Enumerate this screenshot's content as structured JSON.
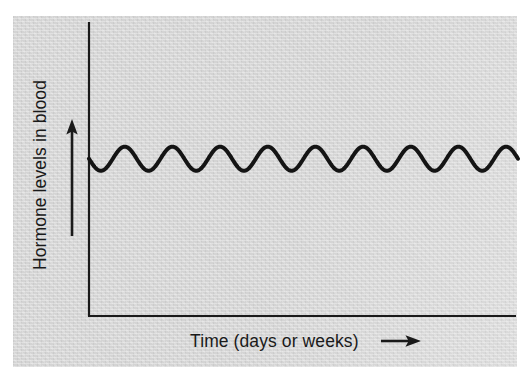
{
  "figure": {
    "background_color": "#ffffff",
    "panel_color": "#d5d5d5",
    "ink_color": "#1a1a1a"
  },
  "chart_data": {
    "type": "line",
    "title": "",
    "subtitle": "",
    "xlabel": "Time (days or weeks)",
    "ylabel": "Hormone levels in blood",
    "grid": false,
    "legend": null,
    "axis_style": "L-shaped spines, no tick marks, no tick labels",
    "x_axis_arrow": true,
    "y_axis_arrow": true,
    "xlim": [
      0,
      9
    ],
    "ylim": [
      0,
      1
    ],
    "annotations": [
      "Upward arrow beside the y-axis label indicating increasing hormone level",
      "Rightward arrow after the x-axis label indicating advancing time"
    ],
    "series": [
      {
        "name": "Hormone level",
        "waveform": "sine",
        "cycles": 9,
        "baseline": 0.535,
        "amplitude": 0.041,
        "phase_deg": 180,
        "description": "Steady low-amplitude oscillation around a constant baseline — hormone levels fluctuate rhythmically but show no overall trend over days or weeks.",
        "x": [
          0.0,
          0.25,
          0.5,
          0.75,
          1.0,
          1.25,
          1.5,
          1.75,
          2.0,
          2.25,
          2.5,
          2.75,
          3.0,
          3.25,
          3.5,
          3.75,
          4.0,
          4.25,
          4.5,
          4.75,
          5.0,
          5.25,
          5.5,
          5.75,
          6.0,
          6.25,
          6.5,
          6.75,
          7.0,
          7.25,
          7.5,
          7.75,
          8.0,
          8.25,
          8.5,
          8.75,
          9.0
        ],
        "values": [
          0.535,
          0.494,
          0.535,
          0.576,
          0.535,
          0.494,
          0.535,
          0.576,
          0.535,
          0.494,
          0.535,
          0.576,
          0.535,
          0.494,
          0.535,
          0.576,
          0.535,
          0.494,
          0.535,
          0.576,
          0.535,
          0.494,
          0.535,
          0.576,
          0.535,
          0.494,
          0.535,
          0.576,
          0.535,
          0.494,
          0.535,
          0.576,
          0.535,
          0.494,
          0.535,
          0.576,
          0.535
        ]
      }
    ]
  }
}
